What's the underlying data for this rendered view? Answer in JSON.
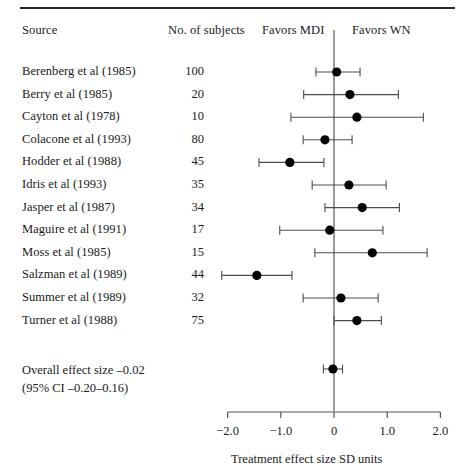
{
  "figure": {
    "type": "forest-plot",
    "header": {
      "source": "Source",
      "subjects": "No. of subjects",
      "favors_left": "Favors MDI",
      "favors_right": "Favors WN"
    },
    "overall": {
      "line1": "Overall effect size –0.02",
      "line2": "(95% CI –0.20–0.16)",
      "estimate": -0.02,
      "ci_low": -0.2,
      "ci_high": 0.16
    },
    "axis_caption": "Treatment effect size SD units"
  },
  "chart_data": {
    "type": "forest",
    "title": "",
    "xlabel": "Treatment effect size SD units",
    "ylabel": "",
    "xlim": [
      -2.0,
      2.0
    ],
    "xticks": [
      -2.0,
      -1.0,
      0,
      1.0,
      2.0
    ],
    "xticklabels": [
      "−2.0",
      "−1.0",
      "0",
      "1.0",
      "2.0"
    ],
    "grid": false,
    "legend": null,
    "reference_line": 0,
    "left_annotation": "Favors MDI",
    "right_annotation": "Favors WN",
    "columns": [
      "Source",
      "No. of subjects"
    ],
    "studies": [
      {
        "source": "Berenberg et al (1985)",
        "n": 100,
        "effect": 0.05,
        "ci_low": -0.34,
        "ci_high": 0.49
      },
      {
        "source": "Berry et al (1985)",
        "n": 20,
        "effect": 0.3,
        "ci_low": -0.57,
        "ci_high": 1.21
      },
      {
        "source": "Cayton et al (1978)",
        "n": 10,
        "effect": 0.43,
        "ci_low": -0.81,
        "ci_high": 1.68
      },
      {
        "source": "Colacone et al (1993)",
        "n": 80,
        "effect": -0.17,
        "ci_low": -0.58,
        "ci_high": 0.34
      },
      {
        "source": "Hodder et al (1988)",
        "n": 45,
        "effect": -0.83,
        "ci_low": -1.41,
        "ci_high": -0.19
      },
      {
        "source": "Idris et al (1993)",
        "n": 35,
        "effect": 0.28,
        "ci_low": -0.41,
        "ci_high": 0.98
      },
      {
        "source": "Jasper et al (1987)",
        "n": 34,
        "effect": 0.53,
        "ci_low": -0.17,
        "ci_high": 1.23
      },
      {
        "source": "Maguire et al (1991)",
        "n": 17,
        "effect": -0.08,
        "ci_low": -1.02,
        "ci_high": 0.92
      },
      {
        "source": "Moss et al (1985)",
        "n": 15,
        "effect": 0.72,
        "ci_low": -0.36,
        "ci_high": 1.75
      },
      {
        "source": "Salzman et al (1989)",
        "n": 44,
        "effect": -1.45,
        "ci_low": -2.11,
        "ci_high": -0.79
      },
      {
        "source": "Summer et al (1989)",
        "n": 32,
        "effect": 0.13,
        "ci_low": -0.58,
        "ci_high": 0.83
      },
      {
        "source": "Turner et al (1988)",
        "n": 75,
        "effect": 0.43,
        "ci_low": 0.0,
        "ci_high": 0.89
      }
    ],
    "summary": {
      "label": "Overall effect size",
      "effect": -0.02,
      "ci_low": -0.2,
      "ci_high": 0.16
    }
  },
  "style": {
    "marker_color": "#000000",
    "line_color": "#4d4d4d",
    "axis_color": "#555555",
    "rule_color": "#2b2b2b",
    "text_color": "#1a1a1a"
  }
}
